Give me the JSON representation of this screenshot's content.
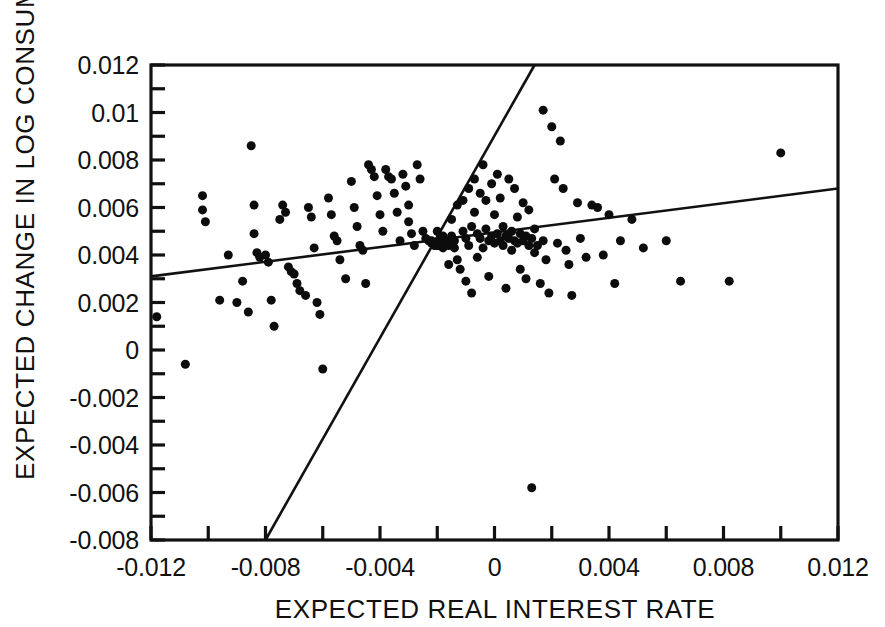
{
  "figure": {
    "background_color": "#ffffff",
    "ink_color": "#111111"
  },
  "chart_data": {
    "type": "scatter",
    "title": "",
    "subtitle": "",
    "xlabel": "EXPECTED REAL INTEREST RATE",
    "ylabel": "EXPECTED CHANGE IN LOG CONSUMPTION",
    "xlim": [
      -0.012,
      0.012
    ],
    "ylim": [
      -0.008,
      0.012
    ],
    "grid": false,
    "legend": null,
    "legend_position": "none",
    "xticks": [
      -0.012,
      -0.008,
      -0.004,
      0,
      0.004,
      0.008,
      0.012
    ],
    "xtick_labels": [
      "-0.012",
      "-0.008",
      "-0.004",
      "0",
      "0.004",
      "0.008",
      "0.012"
    ],
    "xminor_step": 0.002,
    "yticks": [
      0.012,
      0.01,
      0.008,
      0.006,
      0.004,
      0.002,
      0,
      -0.002,
      -0.004,
      -0.006,
      -0.008
    ],
    "ytick_labels": [
      "0.012",
      "0.01",
      "0.008",
      "0.006",
      "0.004",
      "0.002",
      "0",
      "-0.002",
      "-0.004",
      "-0.006",
      "-0.008"
    ],
    "yminor_step": 0.001,
    "marker": "filled-circle",
    "marker_color": "#0c0c0c",
    "marker_size_px": 9,
    "annotations": [],
    "lines": [
      {
        "name": "ols-fit-shallow",
        "x": [
          -0.012,
          0.012
        ],
        "y": [
          0.0031,
          0.0068
        ],
        "slope": 0.154,
        "intercept": 0.00495
      },
      {
        "name": "iv-fit-steep",
        "x": [
          -0.008,
          0.0014
        ],
        "y": [
          -0.008,
          0.012
        ],
        "slope": 2.128,
        "intercept": 0.009024
      }
    ],
    "points": [
      [
        -0.0118,
        0.0014
      ],
      [
        -0.0108,
        -0.0006
      ],
      [
        -0.0102,
        0.0065
      ],
      [
        -0.0102,
        0.0059
      ],
      [
        -0.0101,
        0.0054
      ],
      [
        -0.0096,
        0.0021
      ],
      [
        -0.0093,
        0.004
      ],
      [
        -0.009,
        0.002
      ],
      [
        -0.0088,
        0.0029
      ],
      [
        -0.0086,
        0.0016
      ],
      [
        -0.0085,
        0.0086
      ],
      [
        -0.0084,
        0.0061
      ],
      [
        -0.0084,
        0.0049
      ],
      [
        -0.0083,
        0.0041
      ],
      [
        -0.0082,
        0.0039
      ],
      [
        -0.008,
        0.004
      ],
      [
        -0.0079,
        0.0037
      ],
      [
        -0.0078,
        0.0021
      ],
      [
        -0.0077,
        0.001
      ],
      [
        -0.0075,
        0.0055
      ],
      [
        -0.0074,
        0.0061
      ],
      [
        -0.0073,
        0.0058
      ],
      [
        -0.0072,
        0.0035
      ],
      [
        -0.0071,
        0.0033
      ],
      [
        -0.007,
        0.0032
      ],
      [
        -0.0069,
        0.0028
      ],
      [
        -0.0068,
        0.0025
      ],
      [
        -0.0066,
        0.0023
      ],
      [
        -0.0065,
        0.006
      ],
      [
        -0.0064,
        0.0056
      ],
      [
        -0.0063,
        0.0043
      ],
      [
        -0.0062,
        0.002
      ],
      [
        -0.0061,
        0.0015
      ],
      [
        -0.006,
        -0.0008
      ],
      [
        -0.0058,
        0.0064
      ],
      [
        -0.0057,
        0.0057
      ],
      [
        -0.0056,
        0.0048
      ],
      [
        -0.0055,
        0.0046
      ],
      [
        -0.0054,
        0.0038
      ],
      [
        -0.0052,
        0.003
      ],
      [
        -0.005,
        0.0071
      ],
      [
        -0.0049,
        0.006
      ],
      [
        -0.0048,
        0.0052
      ],
      [
        -0.0047,
        0.0044
      ],
      [
        -0.0046,
        0.0042
      ],
      [
        -0.0045,
        0.0028
      ],
      [
        -0.0044,
        0.0078
      ],
      [
        -0.0043,
        0.0076
      ],
      [
        -0.0042,
        0.0073
      ],
      [
        -0.0041,
        0.0065
      ],
      [
        -0.004,
        0.0057
      ],
      [
        -0.0039,
        0.005
      ],
      [
        -0.0038,
        0.0076
      ],
      [
        -0.0037,
        0.0073
      ],
      [
        -0.0036,
        0.0072
      ],
      [
        -0.0035,
        0.0066
      ],
      [
        -0.0034,
        0.0058
      ],
      [
        -0.0033,
        0.0046
      ],
      [
        -0.0032,
        0.0074
      ],
      [
        -0.0031,
        0.0069
      ],
      [
        -0.003,
        0.0061
      ],
      [
        -0.003,
        0.0054
      ],
      [
        -0.0029,
        0.0049
      ],
      [
        -0.0028,
        0.0044
      ],
      [
        -0.0027,
        0.0078
      ],
      [
        -0.0026,
        0.0072
      ],
      [
        -0.0025,
        0.005
      ],
      [
        -0.0024,
        0.0047
      ],
      [
        -0.0023,
        0.0046
      ],
      [
        -0.0022,
        0.0046
      ],
      [
        -0.0022,
        0.0045
      ],
      [
        -0.0021,
        0.0045
      ],
      [
        -0.0021,
        0.0044
      ],
      [
        -0.002,
        0.0044
      ],
      [
        -0.002,
        0.005
      ],
      [
        -0.0019,
        0.0047
      ],
      [
        -0.0019,
        0.0044
      ],
      [
        -0.0018,
        0.0043
      ],
      [
        -0.0018,
        0.0048
      ],
      [
        -0.0017,
        0.0046
      ],
      [
        -0.0017,
        0.0045
      ],
      [
        -0.0016,
        0.0044
      ],
      [
        -0.0016,
        0.0036
      ],
      [
        -0.0015,
        0.0055
      ],
      [
        -0.0015,
        0.0048
      ],
      [
        -0.0014,
        0.0046
      ],
      [
        -0.0014,
        0.0043
      ],
      [
        -0.0013,
        0.0061
      ],
      [
        -0.0013,
        0.0038
      ],
      [
        -0.0012,
        0.0034
      ],
      [
        -0.0011,
        0.0063
      ],
      [
        -0.0011,
        0.005
      ],
      [
        -0.001,
        0.0047
      ],
      [
        -0.001,
        0.0029
      ],
      [
        -0.0009,
        0.0068
      ],
      [
        -0.0009,
        0.0044
      ],
      [
        -0.0008,
        0.0052
      ],
      [
        -0.0008,
        0.0024
      ],
      [
        -0.0007,
        0.0072
      ],
      [
        -0.0007,
        0.0058
      ],
      [
        -0.0006,
        0.0049
      ],
      [
        -0.0006,
        0.0039
      ],
      [
        -0.0005,
        0.0066
      ],
      [
        -0.0005,
        0.0047
      ],
      [
        -0.0004,
        0.0078
      ],
      [
        -0.0004,
        0.0043
      ],
      [
        -0.0003,
        0.0063
      ],
      [
        -0.0003,
        0.0051
      ],
      [
        -0.0002,
        0.0046
      ],
      [
        -0.0002,
        0.0031
      ],
      [
        -0.0001,
        0.007
      ],
      [
        -0.0001,
        0.0048
      ],
      [
        0.0,
        0.0057
      ],
      [
        0.0,
        0.0045
      ],
      [
        0.0001,
        0.0074
      ],
      [
        0.0001,
        0.0049
      ],
      [
        0.0002,
        0.0064
      ],
      [
        0.0002,
        0.0046
      ],
      [
        0.0003,
        0.0052
      ],
      [
        0.0003,
        0.0044
      ],
      [
        0.0004,
        0.0048
      ],
      [
        0.0004,
        0.0026
      ],
      [
        0.0005,
        0.0072
      ],
      [
        0.0005,
        0.0047
      ],
      [
        0.0006,
        0.005
      ],
      [
        0.0006,
        0.0042
      ],
      [
        0.0007,
        0.0068
      ],
      [
        0.0007,
        0.0046
      ],
      [
        0.0008,
        0.0056
      ],
      [
        0.0008,
        0.0045
      ],
      [
        0.0009,
        0.0049
      ],
      [
        0.0009,
        0.0034
      ],
      [
        0.001,
        0.0062
      ],
      [
        0.001,
        0.0046
      ],
      [
        0.0011,
        0.0048
      ],
      [
        0.0011,
        0.003
      ],
      [
        0.0012,
        0.0059
      ],
      [
        0.0012,
        0.0044
      ],
      [
        0.0013,
        0.0047
      ],
      [
        0.0013,
        -0.0058
      ],
      [
        0.0014,
        0.0051
      ],
      [
        0.0014,
        0.0041
      ],
      [
        0.0015,
        0.0044
      ],
      [
        0.0016,
        0.0028
      ],
      [
        0.0017,
        0.0101
      ],
      [
        0.0017,
        0.0046
      ],
      [
        0.0018,
        0.0038
      ],
      [
        0.0019,
        0.0024
      ],
      [
        0.002,
        0.0094
      ],
      [
        0.0021,
        0.0072
      ],
      [
        0.0022,
        0.0045
      ],
      [
        0.0023,
        0.0088
      ],
      [
        0.0024,
        0.0068
      ],
      [
        0.0025,
        0.0042
      ],
      [
        0.0026,
        0.0036
      ],
      [
        0.0027,
        0.0023
      ],
      [
        0.0029,
        0.0062
      ],
      [
        0.003,
        0.0047
      ],
      [
        0.0032,
        0.0039
      ],
      [
        0.0034,
        0.0061
      ],
      [
        0.0036,
        0.006
      ],
      [
        0.0038,
        0.004
      ],
      [
        0.004,
        0.0057
      ],
      [
        0.0042,
        0.0028
      ],
      [
        0.0044,
        0.0046
      ],
      [
        0.0048,
        0.0055
      ],
      [
        0.0052,
        0.0043
      ],
      [
        0.006,
        0.0046
      ],
      [
        0.0065,
        0.0029
      ],
      [
        0.0082,
        0.0029
      ],
      [
        0.01,
        0.0083
      ]
    ]
  },
  "axes_geometry": {
    "left_px": 151,
    "right_px": 838,
    "top_px": 65,
    "bottom_px": 540,
    "tick_len_px": 14
  }
}
